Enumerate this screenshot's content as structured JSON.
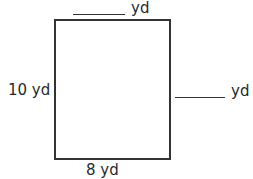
{
  "figure": {
    "shape": "rectangle",
    "labels": {
      "top": {
        "value": "",
        "unit": "yd"
      },
      "right": {
        "value": "",
        "unit": "yd"
      },
      "left": {
        "text": "10 yd"
      },
      "bottom": {
        "text": "8 yd"
      }
    }
  }
}
